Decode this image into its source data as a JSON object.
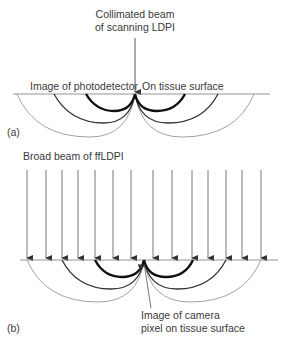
{
  "panel_a": {
    "label": "(a)",
    "title_line1": "Collimated beam",
    "title_line2": "of scanning LDPI",
    "left_caption": "Image of photodetector",
    "right_caption": "On tissue surface"
  },
  "panel_b": {
    "label": "(b)",
    "title": "Broad beam of ffLDPI",
    "caption_line1": "Image of camera",
    "caption_line2": "pixel on tissue surface",
    "arrow_x_positions": [
      27,
      46,
      62,
      78,
      95,
      113,
      131,
      153,
      172,
      192,
      208,
      226,
      242,
      261
    ]
  },
  "colors": {
    "surface_line": "#7a7a7a",
    "thick_arc": "#111111",
    "medium_arc": "#333333",
    "thin_arc": "#8a8a8a",
    "arrow": "#555555",
    "text": "#3a3a3a"
  }
}
